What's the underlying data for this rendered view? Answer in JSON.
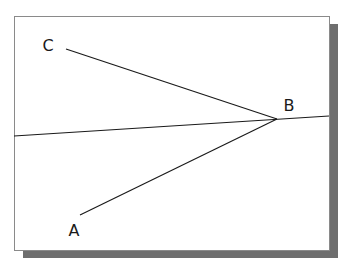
{
  "diagram": {
    "frame": {
      "x": 14,
      "y": 16,
      "width": 315,
      "height": 234,
      "border_color": "#8a8a8a",
      "fill": "#ffffff"
    },
    "shadow": {
      "offset_x": 9,
      "offset_y": 8,
      "color": "#6e6e6e"
    },
    "points": [
      {
        "id": "A",
        "label": "A",
        "x": 80,
        "y": 215,
        "label_x": 74,
        "label_y": 236
      },
      {
        "id": "B",
        "label": "B",
        "x": 277,
        "y": 119,
        "label_x": 289,
        "label_y": 111
      },
      {
        "id": "C",
        "label": "C",
        "x": 66,
        "y": 49,
        "label_x": 48,
        "label_y": 51
      }
    ],
    "segments": [
      {
        "name": "segment-CB",
        "from": [
          66,
          49
        ],
        "to": [
          277,
          119
        ]
      },
      {
        "name": "segment-AB",
        "from": [
          80,
          215
        ],
        "to": [
          277,
          119
        ]
      },
      {
        "name": "line-through-B",
        "from": [
          14,
          136
        ],
        "to": [
          329,
          116
        ]
      }
    ],
    "line_color": "#1a1a1a",
    "label_color": "#1a1a1a"
  }
}
